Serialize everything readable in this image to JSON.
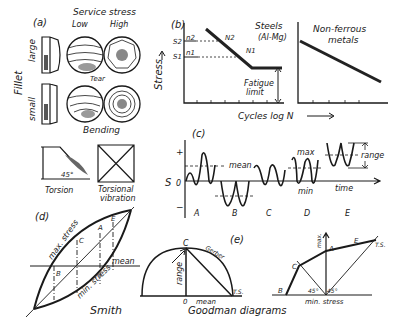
{
  "panel_a": {
    "tag": "(a)",
    "header": "Service stress",
    "col_low": "Low",
    "col_high": "High",
    "row_label": "Fillet",
    "row_large": "large",
    "row_small": "small",
    "tear": "Tear",
    "bending": "Bending",
    "torsion": "Torsion",
    "angle": "45°",
    "torsional_vibration_1": "Torsional",
    "torsional_vibration_2": "vibration"
  },
  "panel_b": {
    "tag": "(b)",
    "ylabel": "Stress",
    "xlabel": "Cycles  log N",
    "s2": "S2",
    "s1": "S1",
    "n2": "n2",
    "n1": "n1",
    "N2": "N2",
    "N1": "N1",
    "steels_1": "Steels",
    "steels_2": "(Al-Mg)",
    "fatigue_1": "Fatigue",
    "fatigue_2": "limit",
    "nonferrous_1": "Non-ferrous",
    "nonferrous_2": "metals"
  },
  "panel_c": {
    "tag": "(c)",
    "s_axis": "S",
    "zero": "0",
    "plus": "+",
    "minus": "−",
    "mean": "mean",
    "max": "max",
    "min": "min",
    "range": "range",
    "time": "time",
    "cases": [
      "A",
      "B",
      "C",
      "D",
      "E"
    ]
  },
  "panel_d": {
    "tag": "(d)",
    "max_stress": "max. stress",
    "min_stress": "min. stress",
    "mean": "mean",
    "points": [
      "A",
      "B",
      "C",
      "E"
    ],
    "title": "Smith"
  },
  "panel_e": {
    "tag": "(e)",
    "gerber": "Gerber",
    "range": "range",
    "zero": "0",
    "mean": "mean",
    "ts": "T.S.",
    "C": "C",
    "max": "max.",
    "A": "A",
    "E": "E",
    "B": "B",
    "min_stress": "min. stress",
    "angle1": "45°",
    "angle2": "45°",
    "title": "Goodman  diagrams"
  }
}
